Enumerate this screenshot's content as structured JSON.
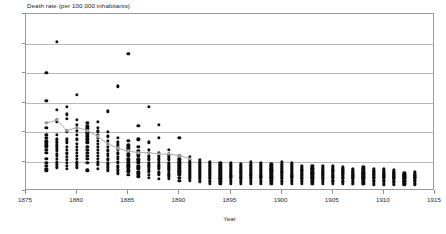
{
  "chart_data": {
    "type": "scatter",
    "title": "Death rate (per 100,000 inhabitants)",
    "xlabel": "Year",
    "ylabel": "",
    "xlim": [
      1875,
      1915
    ],
    "ylim": [
      0,
      120
    ],
    "xticks": [
      1875,
      1880,
      1885,
      1890,
      1895,
      1900,
      1905,
      1910,
      1915
    ],
    "yticks": [
      0,
      20,
      40,
      60,
      80,
      100,
      120
    ],
    "grid": true,
    "legend": "none",
    "colors": {
      "points": "#0d0d0d",
      "average": "#9d9d9d",
      "grid": "#b9b9b9",
      "frame": "#9a9a9a"
    },
    "series": [
      {
        "name": "Regional death rate",
        "type": "scatter",
        "marker": "filled-circle",
        "points_by_year": [
          {
            "x": 1877,
            "y": [
              80,
              61,
              43,
              38,
              36,
              34,
              33,
              31,
              30,
              28,
              26,
              22,
              19,
              17,
              15,
              14
            ]
          },
          {
            "x": 1878,
            "y": [
              101,
              55,
              48,
              47,
              38,
              35,
              33,
              31,
              29,
              27,
              25,
              24,
              22,
              20,
              18,
              16
            ]
          },
          {
            "x": 1879,
            "y": [
              57,
              52,
              49,
              41,
              40,
              35,
              33,
              30,
              28,
              26,
              25,
              23,
              21,
              19,
              17,
              15
            ]
          },
          {
            "x": 1880,
            "y": [
              65,
              48,
              45,
              43,
              41,
              38,
              35,
              32,
              30,
              28,
              26,
              24,
              22,
              20,
              18,
              16
            ]
          },
          {
            "x": 1881,
            "y": [
              46,
              44,
              43,
              42,
              40,
              39,
              37,
              35,
              33,
              30,
              28,
              26,
              24,
              22,
              19,
              14
            ]
          },
          {
            "x": 1882,
            "y": [
              47,
              43,
              41,
              40,
              38,
              36,
              34,
              32,
              30,
              28,
              26,
              24,
              22,
              20,
              18,
              15
            ]
          },
          {
            "x": 1883,
            "y": [
              54,
              40,
              37,
              34,
              32,
              30,
              28,
              27,
              25,
              24,
              22,
              21,
              19,
              18,
              16,
              14
            ]
          },
          {
            "x": 1884,
            "y": [
              71,
              36,
              33,
              31,
              29,
              28,
              26,
              25,
              23,
              22,
              20,
              19,
              17,
              16,
              14,
              12
            ]
          },
          {
            "x": 1885,
            "y": [
              93,
              34,
              31,
              29,
              27,
              25,
              24,
              22,
              21,
              20,
              18,
              17,
              16,
              14,
              13,
              11
            ]
          },
          {
            "x": 1886,
            "y": [
              44,
              35,
              30,
              27,
              25,
              24,
              22,
              21,
              20,
              19,
              17,
              16,
              15,
              13,
              12,
              10
            ]
          },
          {
            "x": 1887,
            "y": [
              57,
              33,
              28,
              26,
              24,
              23,
              22,
              21,
              19,
              18,
              17,
              16,
              14,
              13,
              11,
              9
            ]
          },
          {
            "x": 1888,
            "y": [
              45,
              36,
              26,
              24,
              23,
              22,
              21,
              20,
              18,
              17,
              16,
              15,
              13,
              12,
              11,
              8
            ]
          },
          {
            "x": 1889,
            "y": [
              28,
              25,
              24,
              23,
              22,
              21,
              19,
              18,
              17,
              16,
              15,
              14,
              12,
              11,
              10,
              8
            ]
          },
          {
            "x": 1890,
            "y": [
              36,
              24,
              22,
              21,
              20,
              19,
              18,
              17,
              16,
              15,
              14,
              13,
              12,
              11,
              9,
              7
            ]
          },
          {
            "x": 1891,
            "y": [
              23,
              21,
              20,
              19,
              18,
              17,
              16,
              15,
              14,
              13,
              12,
              11,
              10,
              9,
              8,
              7
            ]
          },
          {
            "x": 1892,
            "y": [
              21,
              20,
              19,
              18,
              17,
              16,
              15,
              14,
              13,
              12,
              11,
              10,
              9,
              8,
              7,
              6
            ]
          },
          {
            "x": 1893,
            "y": [
              20,
              19,
              18,
              17,
              16,
              15,
              14,
              13,
              12,
              11,
              10,
              9,
              8,
              7,
              6,
              5
            ]
          },
          {
            "x": 1894,
            "y": [
              19,
              18,
              17,
              16,
              15,
              14,
              13,
              12,
              11,
              10,
              9,
              8,
              8,
              7,
              6,
              5
            ]
          },
          {
            "x": 1895,
            "y": [
              19,
              18,
              17,
              16,
              15,
              14,
              13,
              12,
              11,
              10,
              10,
              9,
              8,
              7,
              6,
              5
            ]
          },
          {
            "x": 1896,
            "y": [
              18,
              17,
              16,
              15,
              14,
              13,
              13,
              12,
              11,
              10,
              9,
              9,
              8,
              7,
              6,
              5
            ]
          },
          {
            "x": 1897,
            "y": [
              20,
              18,
              17,
              16,
              15,
              14,
              13,
              12,
              11,
              11,
              10,
              9,
              8,
              7,
              6,
              5
            ]
          },
          {
            "x": 1898,
            "y": [
              19,
              18,
              17,
              16,
              15,
              14,
              13,
              12,
              11,
              10,
              10,
              9,
              8,
              7,
              6,
              5
            ]
          },
          {
            "x": 1899,
            "y": [
              18,
              17,
              16,
              15,
              14,
              14,
              13,
              12,
              11,
              10,
              9,
              9,
              8,
              7,
              6,
              5
            ]
          },
          {
            "x": 1900,
            "y": [
              20,
              18,
              17,
              16,
              15,
              14,
              13,
              13,
              12,
              11,
              10,
              9,
              8,
              7,
              6,
              5
            ]
          },
          {
            "x": 1901,
            "y": [
              19,
              18,
              17,
              16,
              15,
              14,
              13,
              12,
              11,
              10,
              10,
              9,
              8,
              7,
              6,
              5
            ]
          },
          {
            "x": 1902,
            "y": [
              17,
              16,
              15,
              14,
              14,
              13,
              12,
              11,
              11,
              10,
              9,
              8,
              8,
              7,
              6,
              5
            ]
          },
          {
            "x": 1903,
            "y": [
              17,
              16,
              15,
              15,
              14,
              13,
              12,
              12,
              11,
              10,
              9,
              9,
              8,
              7,
              6,
              5
            ]
          },
          {
            "x": 1904,
            "y": [
              17,
              16,
              15,
              14,
              13,
              13,
              12,
              11,
              11,
              10,
              9,
              8,
              8,
              7,
              6,
              5
            ]
          },
          {
            "x": 1905,
            "y": [
              17,
              16,
              15,
              14,
              14,
              13,
              12,
              11,
              10,
              10,
              9,
              8,
              7,
              7,
              6,
              5
            ]
          },
          {
            "x": 1906,
            "y": [
              16,
              15,
              14,
              14,
              13,
              12,
              12,
              11,
              10,
              9,
              9,
              8,
              7,
              6,
              6,
              5
            ]
          },
          {
            "x": 1907,
            "y": [
              15,
              14,
              13,
              13,
              12,
              11,
              11,
              10,
              10,
              9,
              8,
              8,
              7,
              6,
              5,
              5
            ]
          },
          {
            "x": 1908,
            "y": [
              16,
              15,
              14,
              13,
              12,
              12,
              11,
              10,
              10,
              9,
              8,
              8,
              7,
              6,
              5,
              5
            ]
          },
          {
            "x": 1909,
            "y": [
              15,
              14,
              13,
              13,
              12,
              11,
              11,
              10,
              9,
              9,
              8,
              7,
              7,
              6,
              5,
              4
            ]
          },
          {
            "x": 1910,
            "y": [
              15,
              14,
              13,
              12,
              12,
              11,
              10,
              10,
              9,
              9,
              8,
              7,
              7,
              6,
              5,
              4
            ]
          },
          {
            "x": 1911,
            "y": [
              14,
              13,
              12,
              12,
              11,
              10,
              10,
              9,
              9,
              8,
              8,
              7,
              6,
              6,
              5,
              4
            ]
          },
          {
            "x": 1912,
            "y": [
              12,
              11,
              11,
              10,
              10,
              9,
              9,
              8,
              8,
              7,
              7,
              6,
              6,
              5,
              5,
              4
            ]
          },
          {
            "x": 1913,
            "y": [
              13,
              12,
              11,
              11,
              10,
              10,
              9,
              9,
              8,
              8,
              7,
              7,
              6,
              5,
              5,
              4
            ]
          }
        ]
      },
      {
        "name": "Average death rate",
        "type": "line",
        "marker": "filled-circle",
        "x": [
          1877,
          1878,
          1879,
          1880,
          1881,
          1882,
          1883,
          1884,
          1885,
          1886,
          1887,
          1888,
          1889,
          1890,
          1891
        ],
        "values": [
          46,
          48,
          41,
          43,
          41,
          37,
          32,
          29,
          27,
          26,
          26,
          25,
          25,
          24,
          22
        ]
      }
    ]
  }
}
